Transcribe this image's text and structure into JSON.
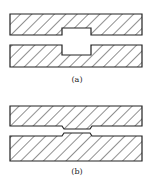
{
  "figures": [
    {
      "id": "a",
      "label": "(a)",
      "description": "channel with widened cavity"
    },
    {
      "id": "b",
      "label": "(b)",
      "description": "channel with narrowed constriction"
    }
  ],
  "colors": {
    "stroke": "#222222",
    "background": "#ffffff"
  }
}
